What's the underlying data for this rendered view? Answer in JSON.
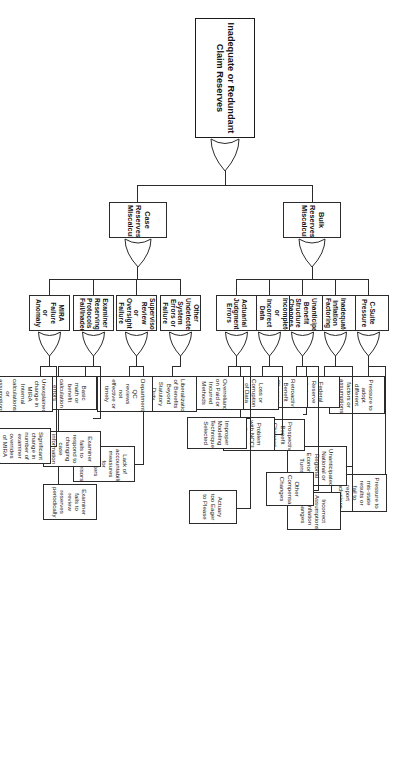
{
  "diagram": {
    "kind": "fault-tree",
    "top_event": "Inadequate or Redundant Claim Reserves",
    "gate_type": "OR",
    "colors": {
      "line": "#2b2b2b",
      "box_fill": "#ffffff",
      "text": "#141414",
      "background": "#ffffff"
    },
    "branches": [
      {
        "label": "Bulk Reserves Miscalculation",
        "causes": [
          {
            "label": "C-Suite Pressure",
            "subcauses": [
              "Pressure to adopt different factors or assumptions",
              "Pressure to mis-state results or fail to report conclusions"
            ]
          },
          {
            "label": "Inadequate Inflation Factoring",
            "subcauses": [
              "Federal Reserve Actions",
              "Unanticipated National or Regional Economic Turns",
              "Incorrect Assumptions of Inflation Changes"
            ]
          },
          {
            "label": "Unanticipated Benefit Structure Changes",
            "subcauses": [
              "Retroactive Benefit Changes",
              "Prospective Benefit Changes",
              "Other Compensability Changes"
            ]
          },
          {
            "label": "Incomplete or Incorrect Data Used",
            "subcauses": [
              "Loss or Corruption of Data Undetected",
              "Problem with NCCI Data Accuracy"
            ]
          },
          {
            "label": "Actuarial Judgment Errors",
            "subcauses": [
              "Overreliance on Paid or Incurred Methods",
              "Improper Modeling Technique Selected",
              "Actuary too Eager to Please"
            ]
          }
        ]
      },
      {
        "label": "Case Reserves Miscalculation",
        "causes": [
          {
            "label": "Other Undetected System Errors or Failure",
            "subcauses": [
              "Liberalization of Benefits Beyond Statutory Duty"
            ]
          },
          {
            "label": "Supervisory Review or Oversight Failure",
            "subcauses": [
              "Department QC reviews not effective or timely",
              "Lack of accountability measures for adjusters or Supervisors"
            ]
          },
          {
            "label": "Examiner Reserving Protocols Fail/Inadequate",
            "subcauses": [
              "Basic math or benefit calculation errors",
              "Examiner fails to respond to changing case information",
              "Examiner fails to review reserves periodically"
            ]
          },
          {
            "label": "MIRA Failure or Anomaly",
            "subcauses": [
              "Unexplained change in MIRA Internal calculations or assumptions",
              "Significant change in number of examiner overrides of MIRA recommendation"
            ]
          }
        ]
      }
    ]
  }
}
